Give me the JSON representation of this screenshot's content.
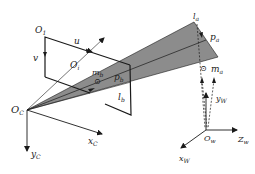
{
  "diagram": {
    "type": "camera-projection-geometry",
    "colors": {
      "line": "#1a1a1a",
      "wedge_fill": "#8c8c8c",
      "wedge_light": "#a8a8a8",
      "background": "#ffffff"
    },
    "labels": {
      "O1": {
        "main": "O",
        "sub": "1"
      },
      "u": {
        "main": "u"
      },
      "v": {
        "main": "v"
      },
      "Oi": {
        "main": "O",
        "sub": "i"
      },
      "mb": {
        "main": "m",
        "sub": "b"
      },
      "pb": {
        "main": "p",
        "sub": "b"
      },
      "lb": {
        "main": "l",
        "sub": "b"
      },
      "la": {
        "main": "l",
        "sub": "a"
      },
      "pa": {
        "main": "p",
        "sub": "a"
      },
      "ma": {
        "main": "m",
        "sub": "a"
      },
      "OC": {
        "main": "O",
        "sub": "C"
      },
      "xC": {
        "main": "x",
        "sub": "C"
      },
      "yC": {
        "main": "y",
        "sub": "C"
      },
      "Ow": {
        "main": "O",
        "sub": "w"
      },
      "yW": {
        "main": "y",
        "sub": "W"
      },
      "Zw": {
        "main": "Z",
        "sub": "w"
      },
      "xW": {
        "main": "x",
        "sub": "W"
      }
    },
    "symbols": {
      "circled_dot": "⊙"
    }
  }
}
